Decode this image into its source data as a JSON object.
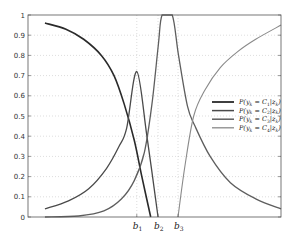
{
  "chart_data": {
    "type": "line",
    "title": "",
    "xlabel": "",
    "ylabel": "",
    "ylim": [
      0,
      1
    ],
    "xlim": [
      0,
      10
    ],
    "grid": true,
    "legend_position": "center-right",
    "yticks": [
      "0",
      "0.1",
      "0.2",
      "0.3",
      "0.4",
      "0.5",
      "0.6",
      "0.7",
      "0.8",
      "0.9",
      "1"
    ],
    "xtick_labels": [
      {
        "label": "b",
        "sub": "1",
        "x": 4.3
      },
      {
        "label": "b",
        "sub": "2",
        "x": 5.14
      },
      {
        "label": "b",
        "sub": "3",
        "x": 5.93
      }
    ],
    "series": [
      {
        "name": "P(y_k = C_1|z_k)",
        "legend_main": "P(y",
        "legend_rest": "= C",
        "legend_idx": "1",
        "color": "#2a2a2a",
        "width": 1.6,
        "points": [
          [
            0.67,
            0.96
          ],
          [
            1.5,
            0.93
          ],
          [
            2.2,
            0.88
          ],
          [
            2.9,
            0.8
          ],
          [
            3.4,
            0.7
          ],
          [
            3.8,
            0.56
          ],
          [
            4.2,
            0.38
          ],
          [
            4.5,
            0.2
          ],
          [
            4.85,
            0.0
          ]
        ]
      },
      {
        "name": "P(y_k = C_2|z_k)",
        "legend_main": "P(y",
        "legend_rest": "= C",
        "legend_idx": "2",
        "color": "#4a4a4a",
        "width": 1.3,
        "points": [
          [
            0.67,
            0.04
          ],
          [
            1.6,
            0.08
          ],
          [
            2.4,
            0.14
          ],
          [
            3.1,
            0.24
          ],
          [
            3.6,
            0.35
          ],
          [
            3.9,
            0.44
          ],
          [
            4.3,
            0.72
          ],
          [
            4.7,
            0.4
          ],
          [
            5.14,
            0.0
          ]
        ]
      },
      {
        "name": "P(y_k = C_3|z_k)",
        "legend_main": "P(y",
        "legend_rest": "= C",
        "legend_idx": "3",
        "color": "#5e5e5e",
        "width": 1.3,
        "points": [
          [
            0.67,
            0.0
          ],
          [
            2.0,
            0.005
          ],
          [
            3.0,
            0.03
          ],
          [
            3.7,
            0.09
          ],
          [
            4.2,
            0.18
          ],
          [
            4.6,
            0.32
          ],
          [
            4.9,
            0.56
          ],
          [
            5.15,
            0.85
          ],
          [
            5.3,
            1.0
          ],
          [
            5.7,
            1.0
          ],
          [
            5.95,
            0.8
          ],
          [
            6.3,
            0.55
          ],
          [
            6.6,
            0.45
          ],
          [
            7.2,
            0.3
          ],
          [
            8.0,
            0.17
          ],
          [
            9.0,
            0.09
          ],
          [
            10.0,
            0.04
          ]
        ]
      },
      {
        "name": "P(y_k = C_4|z_k)",
        "legend_main": "P(y",
        "legend_rest": "= C",
        "legend_idx": "4",
        "color": "#8a8a8a",
        "width": 1.1,
        "points": [
          [
            5.93,
            0.0
          ],
          [
            6.2,
            0.25
          ],
          [
            6.55,
            0.5
          ],
          [
            7.0,
            0.63
          ],
          [
            7.6,
            0.74
          ],
          [
            8.3,
            0.82
          ],
          [
            9.0,
            0.88
          ],
          [
            10.0,
            0.95
          ]
        ]
      }
    ]
  }
}
